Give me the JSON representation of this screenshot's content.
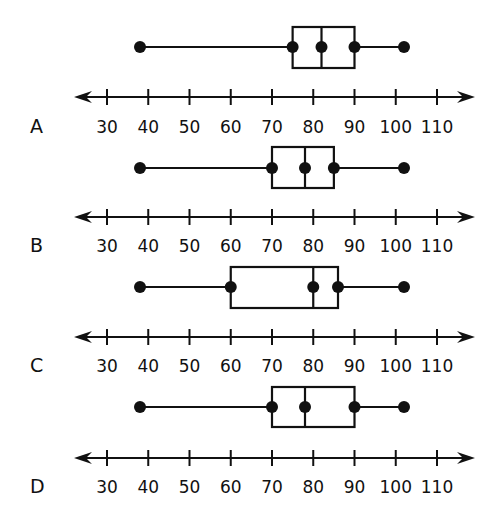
{
  "chart_data": [
    {
      "type": "box",
      "option": "A",
      "xlabel": "",
      "ylabel": "",
      "xlim": [
        30,
        110
      ],
      "tick_labels": [
        "30",
        "40",
        "50",
        "60",
        "70",
        "80",
        "90",
        "100",
        "110"
      ],
      "ticks": [
        30,
        40,
        50,
        60,
        70,
        80,
        90,
        100,
        110
      ],
      "min": 38,
      "q1": 75,
      "median": 82,
      "q3": 90,
      "max": 102
    },
    {
      "type": "box",
      "option": "B",
      "xlabel": "",
      "ylabel": "",
      "xlim": [
        30,
        110
      ],
      "tick_labels": [
        "30",
        "40",
        "50",
        "60",
        "70",
        "80",
        "90",
        "100",
        "110"
      ],
      "ticks": [
        30,
        40,
        50,
        60,
        70,
        80,
        90,
        100,
        110
      ],
      "min": 38,
      "q1": 70,
      "median": 78,
      "q3": 85,
      "max": 102
    },
    {
      "type": "box",
      "option": "C",
      "xlabel": "",
      "ylabel": "",
      "xlim": [
        30,
        110
      ],
      "tick_labels": [
        "30",
        "40",
        "50",
        "60",
        "70",
        "80",
        "90",
        "100",
        "110"
      ],
      "ticks": [
        30,
        40,
        50,
        60,
        70,
        80,
        90,
        100,
        110
      ],
      "min": 38,
      "q1": 60,
      "median": 80,
      "q3": 86,
      "max": 102
    },
    {
      "type": "box",
      "option": "D",
      "xlabel": "",
      "ylabel": "",
      "xlim": [
        30,
        110
      ],
      "tick_labels": [
        "30",
        "40",
        "50",
        "60",
        "70",
        "80",
        "90",
        "100",
        "110"
      ],
      "ticks": [
        30,
        40,
        50,
        60,
        70,
        80,
        90,
        100,
        110
      ],
      "min": 38,
      "q1": 70,
      "median": 78,
      "q3": 90,
      "max": 102
    }
  ],
  "layout": {
    "plots": [
      {
        "box_top": 27,
        "box_bottom": 68,
        "whisker_y": 47,
        "axis_y": 97,
        "label_y": 133
      },
      {
        "box_top": 147,
        "box_bottom": 188,
        "whisker_y": 168,
        "axis_y": 217,
        "label_y": 252
      },
      {
        "box_top": 267,
        "box_bottom": 308,
        "whisker_y": 287,
        "axis_y": 337,
        "label_y": 372
      },
      {
        "box_top": 387,
        "box_bottom": 427,
        "whisker_y": 407,
        "axis_y": 458,
        "label_y": 493
      }
    ],
    "x_of_30": 107,
    "px_per_10": 41.25,
    "axis_left": 74,
    "axis_right": 475,
    "option_label_x": 30,
    "line_color": "#111111"
  }
}
